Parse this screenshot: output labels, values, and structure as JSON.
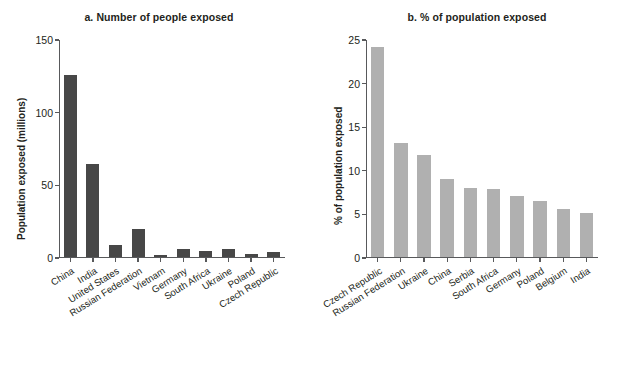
{
  "figure": {
    "width": 636,
    "height": 366,
    "background": "#ffffff"
  },
  "colors": {
    "panel_a_bar": "#474747",
    "panel_b_bar": "#b0b0b0",
    "axis": "#58595b",
    "text": "#231f20"
  },
  "chart_data": [
    {
      "type": "bar",
      "title": "a. Number of people exposed",
      "xlabel": "",
      "ylabel": "Population exposed (millions)",
      "ylim": [
        0,
        150
      ],
      "yticks": [
        0,
        50,
        100,
        150
      ],
      "ytick_labels": [
        "0",
        "50",
        "100",
        "150"
      ],
      "grid": false,
      "legend": "none",
      "bar_color": "#474747",
      "categories": [
        "China",
        "India",
        "United States",
        "Russian Federation",
        "Vietnam",
        "Germany",
        "South Africa",
        "Ukraine",
        "Poland",
        "Czech Republic"
      ],
      "values": [
        125,
        64,
        8,
        19,
        1,
        5.5,
        4,
        5,
        2,
        3.5
      ]
    },
    {
      "type": "bar",
      "title": "b. % of population exposed",
      "xlabel": "",
      "ylabel": "% of population exposed",
      "ylim": [
        0,
        25
      ],
      "yticks": [
        0,
        5,
        10,
        15,
        20,
        25
      ],
      "ytick_labels": [
        "0",
        "5",
        "10",
        "15",
        "20",
        "25"
      ],
      "grid": false,
      "legend": "none",
      "bar_color": "#b0b0b0",
      "categories": [
        "Czech Republic",
        "Russian Federation",
        "Ukraine",
        "China",
        "Serbia",
        "South Africa",
        "Germany",
        "Poland",
        "Belgium",
        "India"
      ],
      "values": [
        24,
        13,
        11.7,
        8.9,
        7.9,
        7.8,
        7.0,
        6.4,
        5.5,
        5.0
      ]
    }
  ]
}
